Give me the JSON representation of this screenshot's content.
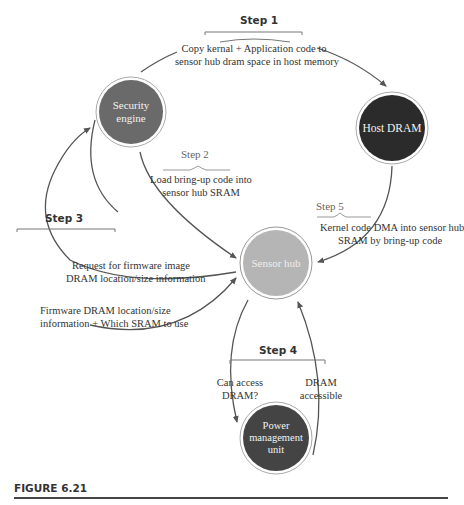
{
  "figure": {
    "caption": "FIGURE 6.21",
    "colors": {
      "security_engine": "#6a6a6a",
      "host_dram": "#2b2b2b",
      "sensor_hub": "#b5b5b5",
      "power_management_unit": "#444444",
      "arrow": "#555555"
    },
    "nodes": {
      "security_engine": "Security engine",
      "host_dram": "Host DRAM",
      "sensor_hub": "Sensor hub",
      "power_management_unit": "Power management unit"
    },
    "node_lines": {
      "security_engine": [
        "Security",
        "engine"
      ],
      "host_dram": [
        "Host DRAM"
      ],
      "sensor_hub": [
        "Sensor hub"
      ],
      "power_management_unit": [
        "Power",
        "management",
        "unit"
      ]
    },
    "steps": {
      "step1": {
        "label": "Step 1",
        "text": [
          "Copy kernal + Application code to",
          "sensor hub dram space in host memory"
        ]
      },
      "step2": {
        "label": "Step 2",
        "text": [
          "Load bring-up code into",
          "sensor hub SRAM"
        ]
      },
      "step3": {
        "label": "Step 3",
        "request": [
          "Request for firmware image",
          "DRAM location/size information"
        ],
        "response": [
          "Firmware DRAM location/size",
          "information + Which SRAM to use"
        ]
      },
      "step4": {
        "label": "Step 4",
        "query": [
          "Can access",
          "DRAM?"
        ],
        "reply": [
          "DRAM",
          "accessible"
        ]
      },
      "step5": {
        "label": "Step 5",
        "text": [
          "Kernel code DMA into sensor hub",
          "SRAM by bring-up code"
        ]
      }
    }
  }
}
